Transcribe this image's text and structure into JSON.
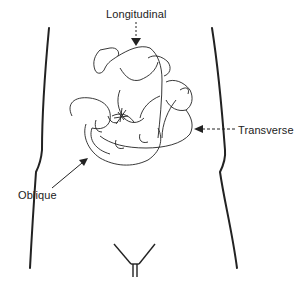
{
  "diagram": {
    "labels": {
      "longitudinal": "Longitudinal",
      "transverse": "Transverse",
      "oblique": "Oblique"
    },
    "colors": {
      "background": "#ffffff",
      "line": "#222222",
      "text": "#222222"
    },
    "elements": [
      {
        "name": "torso-outline",
        "description": "Outline of maternal torso, left and right flanks"
      },
      {
        "name": "fetus-longitudinal",
        "description": "Fetus lying along vertical axis"
      },
      {
        "name": "fetus-transverse",
        "description": "Fetus lying horizontally across abdomen"
      },
      {
        "name": "fetus-oblique",
        "description": "Fetus lying diagonally"
      },
      {
        "name": "pubic-outline",
        "description": "V-shaped groin outline at bottom"
      }
    ],
    "arrows": [
      {
        "label": "Longitudinal",
        "direction": "down",
        "style": "dashed"
      },
      {
        "label": "Transverse",
        "direction": "left",
        "style": "dashed"
      },
      {
        "label": "Oblique",
        "direction": "up-right",
        "style": "solid"
      }
    ]
  }
}
